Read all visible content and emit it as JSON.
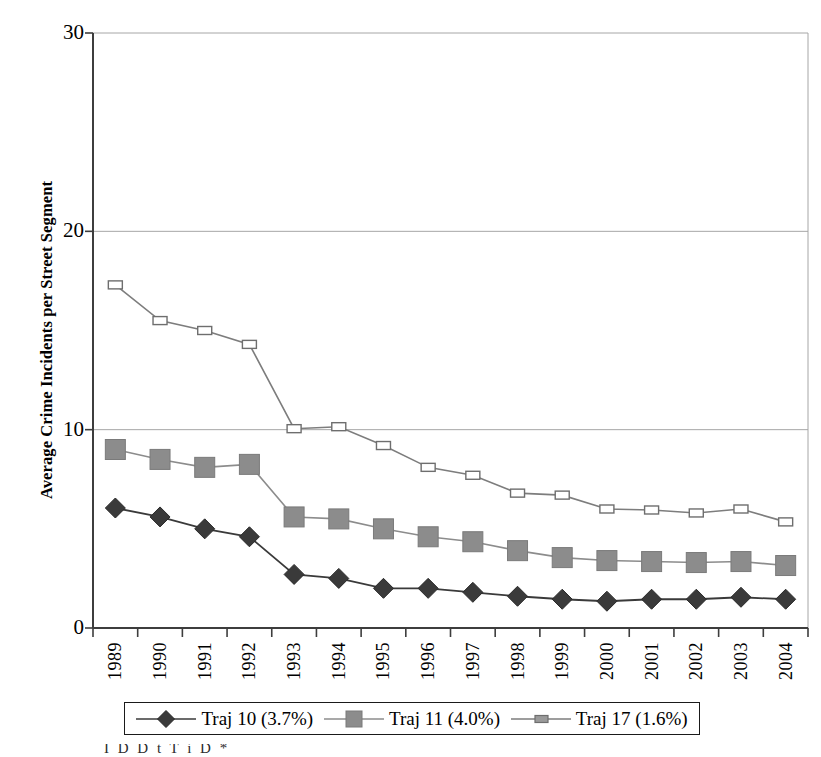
{
  "chart_data": {
    "type": "line",
    "title": "",
    "xlabel": "",
    "ylabel": "Average Crime Incidents per Street Segment",
    "ylim": [
      0,
      30
    ],
    "yticks": [
      0,
      10,
      20,
      30
    ],
    "grid": "horizontal",
    "legend_position": "bottom",
    "categories": [
      "1989",
      "1990",
      "1991",
      "1992",
      "1993",
      "1994",
      "1995",
      "1996",
      "1997",
      "1998",
      "1999",
      "2000",
      "2001",
      "2002",
      "2003",
      "2004"
    ],
    "series": [
      {
        "name": "Traj 10 (3.7%)",
        "marker": "filled-diamond",
        "color": "#3a3a3a",
        "values": [
          6.05,
          5.6,
          5.0,
          4.6,
          2.7,
          2.5,
          2.0,
          2.0,
          1.8,
          1.6,
          1.45,
          1.35,
          1.45,
          1.45,
          1.55,
          1.45
        ]
      },
      {
        "name": "Traj 11 (4.0%)",
        "marker": "filled-square",
        "color": "#8c8c8c",
        "values": [
          9.0,
          8.5,
          8.1,
          8.25,
          5.6,
          5.5,
          5.0,
          4.6,
          4.35,
          3.9,
          3.55,
          3.4,
          3.35,
          3.3,
          3.35,
          3.15
        ]
      },
      {
        "name": "Traj 17 (1.6%)",
        "marker": "open-square",
        "color": "#7d7d7d",
        "values": [
          17.3,
          15.5,
          15.0,
          14.3,
          10.05,
          10.15,
          9.2,
          8.1,
          7.7,
          6.8,
          6.7,
          6.0,
          5.95,
          5.8,
          6.0,
          5.35
        ]
      }
    ]
  },
  "legend": {
    "items": [
      {
        "label": "Traj 10 (3.7%)",
        "marker": "filled-diamond"
      },
      {
        "label": "Traj 11 (4.0%)",
        "marker": "filled-square"
      },
      {
        "label": "Traj 17 (1.6%)",
        "marker": "open-square"
      }
    ]
  },
  "caption": {
    "partial_line": "I    D     D        t    T  i         D        *"
  },
  "colors": {
    "traj10": "#3a3a3a",
    "traj11": "#8c8c8c",
    "traj17": "#7d7d7d",
    "axis": "#3d3d3d",
    "grid": "#a6a6a6"
  }
}
